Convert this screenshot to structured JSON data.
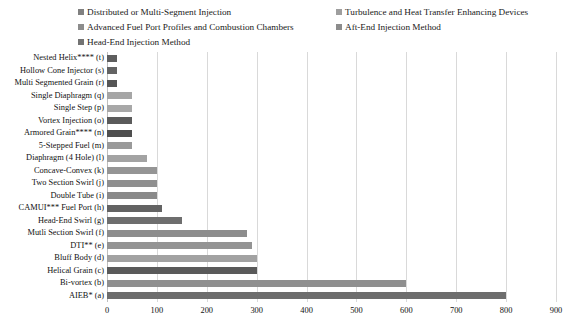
{
  "legend": {
    "position": "top",
    "items": [
      {
        "label": "Distributed or Multi-Segment Injection",
        "color": "#808080"
      },
      {
        "label": "Advanced Fuel Port Profiles and Combustion Chambers",
        "color": "#8c8c8c"
      },
      {
        "label": "Head-End Injection Method",
        "color": "#737373"
      },
      {
        "label": "Turbulence and Heat Transfer Enhancing Devices",
        "color": "#9e9e9e"
      },
      {
        "label": "Aft-End Injection Method",
        "color": "#8c8c8c"
      }
    ]
  },
  "chart_data": {
    "type": "bar",
    "orientation": "horizontal",
    "title": "",
    "xlabel": "",
    "ylabel": "",
    "xlim": [
      0,
      900
    ],
    "xticks": [
      0,
      100,
      200,
      300,
      400,
      500,
      600,
      700,
      800,
      900
    ],
    "grid": true,
    "categories": [
      "Nested Helix**** (t)",
      "Hollow Cone Injector (s)",
      "Multi Segmented Grain (r)",
      "Single Diaphragm (q)",
      "Single Step (p)",
      "Vortex Injection (o)",
      "Armored Grain**** (n)",
      "5-Stepped Fuel (m)",
      "Diaphragm (4 Hole) (l)",
      "Concave-Convex (k)",
      "Two Section Swirl (j)",
      "Double Tube (i)",
      "CAMUI*** Fuel Port (h)",
      "Head-End Swirl (g)",
      "Mutli Section Swirl (f)",
      "DTI** (e)",
      "Bluff Body (d)",
      "Helical Grain (c)",
      "Bi-vortex (b)",
      "AIEB* (a)"
    ],
    "values": [
      20,
      20,
      20,
      50,
      50,
      50,
      50,
      50,
      80,
      100,
      100,
      100,
      110,
      150,
      280,
      290,
      300,
      300,
      600,
      800
    ],
    "bar_colors": [
      "#5e5e5e",
      "#636363",
      "#565656",
      "#a6a6a6",
      "#a8a8a8",
      "#5b5b5b",
      "#4f4f4f",
      "#9a9a9a",
      "#a3a3a3",
      "#959595",
      "#8f8f8f",
      "#8a8a8a",
      "#636363",
      "#6e6e6e",
      "#8d8d8d",
      "#949494",
      "#a2a2a2",
      "#5a5a5a",
      "#8f8f8f",
      "#6d6d6d"
    ]
  }
}
